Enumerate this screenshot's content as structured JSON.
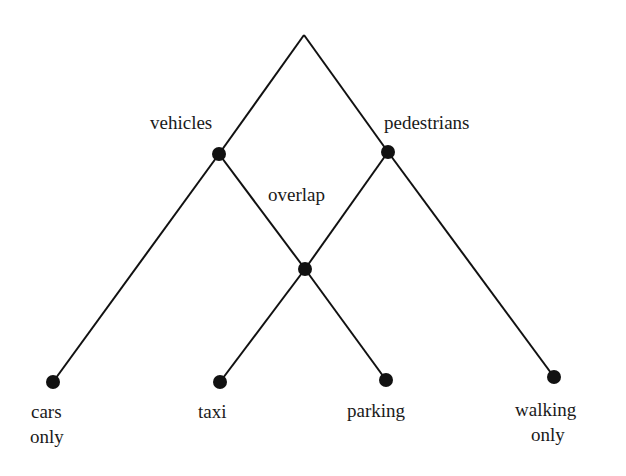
{
  "diagram": {
    "type": "lattice",
    "colors": {
      "line": "#111111",
      "node": "#111111",
      "text": "#1a1a1a",
      "background": "#ffffff"
    },
    "nodes": [
      {
        "id": "root",
        "label": "",
        "x": 304,
        "y": 35,
        "dot": false
      },
      {
        "id": "vehicles",
        "label": "vehicles",
        "x": 219,
        "y": 154,
        "dot": true
      },
      {
        "id": "pedestrians",
        "label": "pedestrians",
        "x": 388,
        "y": 152,
        "dot": true
      },
      {
        "id": "overlap",
        "label": "overlap",
        "x": 305,
        "y": 269,
        "dot": true
      },
      {
        "id": "cars_only",
        "label": "cars only",
        "x": 53,
        "y": 382,
        "dot": true
      },
      {
        "id": "taxi",
        "label": "taxi",
        "x": 220,
        "y": 382,
        "dot": true
      },
      {
        "id": "parking",
        "label": "parking",
        "x": 386,
        "y": 380,
        "dot": true
      },
      {
        "id": "walking_only",
        "label": "walking only",
        "x": 554,
        "y": 377,
        "dot": true
      }
    ],
    "edges": [
      [
        "root",
        "vehicles"
      ],
      [
        "root",
        "pedestrians"
      ],
      [
        "vehicles",
        "cars_only"
      ],
      [
        "vehicles",
        "overlap"
      ],
      [
        "pedestrians",
        "overlap"
      ],
      [
        "pedestrians",
        "walking_only"
      ],
      [
        "overlap",
        "taxi"
      ],
      [
        "overlap",
        "parking"
      ]
    ],
    "labels": {
      "vehicles": "vehicles",
      "pedestrians": "pedestrians",
      "overlap": "overlap",
      "cars_line1": "cars",
      "cars_line2": "only",
      "taxi": "taxi",
      "parking": "parking",
      "walking_line1": "walking",
      "walking_line2": "only"
    }
  }
}
